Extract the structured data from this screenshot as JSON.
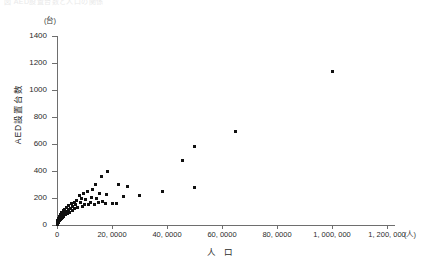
{
  "caption": {
    "top_clipped_text": "図  AED設置台数と人口の関係"
  },
  "chart_data": {
    "type": "scatter",
    "title": "",
    "xlabel": "人 口",
    "ylabel": "AED設置台数",
    "x_unit": "(人)",
    "y_unit": "(台)",
    "xlim": [
      0,
      1250000
    ],
    "ylim": [
      0,
      1480
    ],
    "grid": false,
    "legend": "none",
    "xticks": [
      0,
      200000,
      400000,
      600000,
      800000,
      1000000,
      1200000
    ],
    "xticklabels": [
      "0",
      "20, 0000",
      "40, 0000",
      "60, 0000",
      "80, 0000",
      "1, 000, 000",
      "1, 200, 000"
    ],
    "yticks": [
      0,
      200,
      400,
      600,
      800,
      1000,
      1200,
      1400
    ],
    "yticklabels": [
      "0",
      "200",
      "400",
      "600",
      "800",
      "1000",
      "1200",
      "1400"
    ],
    "marker": "square",
    "marker_color": "#111111",
    "points": [
      [
        1000000,
        1140
      ],
      [
        650000,
        690
      ],
      [
        500000,
        580
      ],
      [
        455000,
        480
      ],
      [
        500000,
        280
      ],
      [
        385000,
        250
      ],
      [
        300000,
        220
      ],
      [
        255000,
        285
      ],
      [
        240000,
        210
      ],
      [
        225000,
        300
      ],
      [
        215000,
        160
      ],
      [
        200000,
        160
      ],
      [
        185000,
        400
      ],
      [
        180000,
        225
      ],
      [
        175000,
        160
      ],
      [
        165000,
        175
      ],
      [
        160000,
        360
      ],
      [
        155000,
        235
      ],
      [
        150000,
        170
      ],
      [
        145000,
        195
      ],
      [
        140000,
        300
      ],
      [
        135000,
        150
      ],
      [
        130000,
        260
      ],
      [
        125000,
        205
      ],
      [
        120000,
        165
      ],
      [
        115000,
        150
      ],
      [
        110000,
        245
      ],
      [
        105000,
        190
      ],
      [
        100000,
        155
      ],
      [
        95000,
        230
      ],
      [
        92000,
        140
      ],
      [
        88000,
        200
      ],
      [
        84000,
        170
      ],
      [
        80000,
        215
      ],
      [
        76000,
        130
      ],
      [
        72000,
        185
      ],
      [
        68000,
        150
      ],
      [
        65000,
        120
      ],
      [
        62000,
        170
      ],
      [
        58000,
        140
      ],
      [
        55000,
        110
      ],
      [
        52000,
        160
      ],
      [
        49000,
        125
      ],
      [
        46000,
        95
      ],
      [
        43000,
        145
      ],
      [
        40000,
        115
      ],
      [
        38000,
        85
      ],
      [
        35000,
        130
      ],
      [
        33000,
        100
      ],
      [
        31000,
        75
      ],
      [
        29000,
        115
      ],
      [
        27000,
        90
      ],
      [
        25000,
        65
      ],
      [
        23000,
        105
      ],
      [
        21000,
        80
      ],
      [
        19000,
        58
      ],
      [
        18000,
        95
      ],
      [
        17000,
        70
      ],
      [
        16000,
        50
      ],
      [
        15000,
        85
      ],
      [
        14000,
        62
      ],
      [
        13000,
        42
      ],
      [
        12000,
        75
      ],
      [
        11000,
        55
      ],
      [
        10000,
        38
      ],
      [
        9500,
        66
      ],
      [
        9000,
        48
      ],
      [
        8500,
        32
      ],
      [
        8000,
        58
      ],
      [
        7500,
        42
      ],
      [
        7000,
        28
      ],
      [
        6500,
        50
      ],
      [
        6000,
        36
      ],
      [
        5500,
        24
      ],
      [
        5000,
        44
      ],
      [
        4500,
        30
      ],
      [
        4000,
        20
      ],
      [
        3500,
        36
      ],
      [
        3000,
        26
      ],
      [
        2500,
        16
      ],
      [
        2200,
        30
      ],
      [
        2000,
        22
      ],
      [
        1800,
        13
      ],
      [
        1500,
        26
      ],
      [
        1300,
        18
      ],
      [
        1000,
        10
      ],
      [
        800,
        20
      ],
      [
        600,
        14
      ],
      [
        400,
        8
      ],
      [
        300,
        16
      ],
      [
        200,
        11
      ],
      [
        100,
        6
      ]
    ]
  }
}
